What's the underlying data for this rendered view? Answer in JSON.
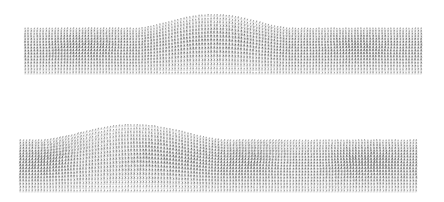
{
  "figure": {
    "title": "",
    "background_color": "#ffffff",
    "width": 444,
    "height": 202,
    "panel_count": 2
  },
  "chart_data": [
    {
      "type": "quiver",
      "name": "upper-velocity-field",
      "title": "",
      "xlabel": "",
      "ylabel": "",
      "grid": true,
      "grid_color": "#b9b9b9",
      "arrow_color": "#2b2b2b",
      "legend": [],
      "annotations": [],
      "domain": {
        "x_pixel_range": [
          25,
          421
        ],
        "y_pixel_top_base": 30,
        "y_pixel_bottom": 74,
        "nx": 132,
        "ny": 15
      },
      "terrain": {
        "description": "single broad hill raising the upper free surface",
        "bumps": [
          {
            "center_x": 0.475,
            "half_width": 0.195,
            "height": 0.52
          }
        ]
      },
      "vortices": [
        {
          "cx": 0.075,
          "cy": 0.4,
          "strength": -0.85,
          "radius": 0.075
        },
        {
          "cx": 0.215,
          "cy": 0.48,
          "strength": 0.8,
          "radius": 0.07
        },
        {
          "cx": 0.4,
          "cy": 0.45,
          "strength": -0.55,
          "radius": 0.075
        },
        {
          "cx": 0.56,
          "cy": 0.5,
          "strength": 0.6,
          "radius": 0.075
        },
        {
          "cx": 0.79,
          "cy": 0.42,
          "strength": -0.8,
          "radius": 0.075
        },
        {
          "cx": 0.905,
          "cy": 0.48,
          "strength": 0.75,
          "radius": 0.07
        }
      ],
      "base_flow": {
        "u": 0.1,
        "v": -0.62
      },
      "max_arrow_length_px": 7.0,
      "x": [
        0.0,
        0.25,
        0.5,
        0.75,
        1.0
      ],
      "values": [
        0.0,
        0.0,
        0.52,
        0.0,
        0.0
      ]
    },
    {
      "type": "quiver",
      "name": "lower-velocity-field",
      "title": "",
      "xlabel": "",
      "ylabel": "",
      "grid": true,
      "grid_color": "#b9b9b9",
      "arrow_color": "#2b2b2b",
      "legend": [],
      "annotations": [],
      "domain": {
        "x_pixel_range": [
          20,
          416
        ],
        "y_pixel_top_base": 142,
        "y_pixel_bottom": 192,
        "nx": 132,
        "ny": 17
      },
      "terrain": {
        "description": "broad left-of-centre hill raising the upper free surface",
        "bumps": [
          {
            "center_x": 0.285,
            "half_width": 0.235,
            "height": 0.42
          }
        ]
      },
      "vortices": [
        {
          "cx": 0.115,
          "cy": 0.45,
          "strength": 0.95,
          "radius": 0.085
        },
        {
          "cx": 0.285,
          "cy": 0.42,
          "strength": -0.7,
          "radius": 0.085
        },
        {
          "cx": 0.45,
          "cy": 0.5,
          "strength": 0.5,
          "radius": 0.075
        },
        {
          "cx": 0.62,
          "cy": 0.45,
          "strength": 0.95,
          "radius": 0.085
        },
        {
          "cx": 0.805,
          "cy": 0.48,
          "strength": -0.95,
          "radius": 0.085
        },
        {
          "cx": 0.945,
          "cy": 0.45,
          "strength": 0.55,
          "radius": 0.075
        }
      ],
      "base_flow": {
        "u": 0.12,
        "v": -0.6
      },
      "max_arrow_length_px": 7.6,
      "x": [
        0.0,
        0.25,
        0.5,
        0.75,
        1.0
      ],
      "values": [
        0.0,
        0.4,
        0.0,
        0.0,
        0.0
      ]
    }
  ]
}
